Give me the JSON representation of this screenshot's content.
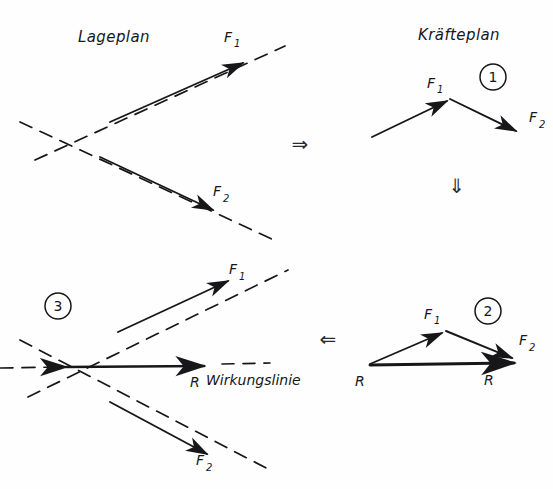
{
  "figure": {
    "type": "engineering-diagram",
    "language": "de",
    "ink_color": "#17171a",
    "background_color": "#fefefe",
    "width": 553,
    "height": 489
  },
  "titles": {
    "left": "Lageplan",
    "right": "Kräfteplan"
  },
  "step_markers": [
    {
      "id": "marker-1",
      "label": "1",
      "x": 493,
      "y": 77
    },
    {
      "id": "marker-2",
      "label": "2",
      "x": 488,
      "y": 311
    },
    {
      "id": "marker-3",
      "label": "3",
      "x": 58,
      "y": 306
    }
  ],
  "operators": [
    {
      "id": "op-right",
      "glyph": "⇒",
      "name": "double-arrow-right",
      "x": 300,
      "y": 143
    },
    {
      "id": "op-down",
      "glyph": "⇓",
      "name": "double-arrow-down",
      "x": 457,
      "y": 185
    },
    {
      "id": "op-left",
      "glyph": "⇐",
      "name": "double-arrow-left",
      "x": 328,
      "y": 338
    }
  ],
  "panels": {
    "lageplan_top": {
      "name": "Lageplan (situation plan) — step 0",
      "intersection": {
        "x": 62,
        "y": 143
      },
      "labels": [
        {
          "base": "F",
          "sub": "1",
          "x": 224,
          "y": 42
        },
        {
          "base": "F",
          "sub": "2",
          "x": 213,
          "y": 196
        }
      ]
    },
    "kraefteplan_1": {
      "name": "Kräfteplan — step 1: force chain",
      "labels": [
        {
          "base": "F",
          "sub": "1",
          "x": 427,
          "y": 88
        },
        {
          "base": "F",
          "sub": "2",
          "x": 529,
          "y": 122
        }
      ]
    },
    "kraefteplan_2": {
      "name": "Kräfteplan — step 2: force triangle with resultant",
      "labels": [
        {
          "base": "F",
          "sub": "1",
          "x": 424,
          "y": 319
        },
        {
          "base": "F",
          "sub": "2",
          "x": 519,
          "y": 345
        },
        {
          "base": "R",
          "sub": "",
          "x": 484,
          "y": 385
        }
      ]
    },
    "lageplan_3": {
      "name": "Lageplan — step 3: resultant line of action",
      "intersection": {
        "x": 57,
        "y": 367
      },
      "labels": [
        {
          "base": "F",
          "sub": "1",
          "x": 229,
          "y": 274
        },
        {
          "base": "F",
          "sub": "2",
          "x": 196,
          "y": 465
        },
        {
          "base": "R",
          "sub": "",
          "x": 190,
          "y": 387
        },
        {
          "base": "R",
          "sub": "",
          "x": 355,
          "y": 386
        }
      ],
      "annotation": "Wirkungslinie"
    }
  }
}
